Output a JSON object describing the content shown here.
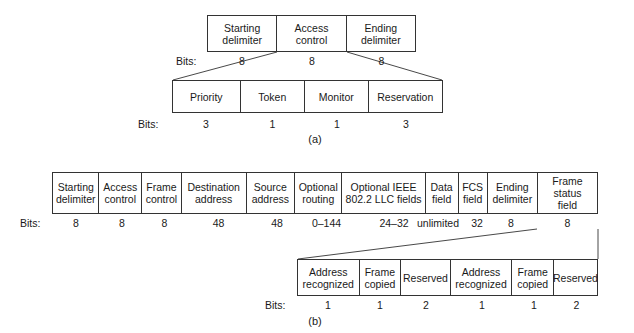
{
  "figure": {
    "section_a": {
      "caption": "(a)",
      "bits_label": "Bits:",
      "top_row": {
        "fields": [
          {
            "label": "Starting\ndelimiter",
            "bits": "8"
          },
          {
            "label": "Access\ncontrol",
            "bits": "8"
          },
          {
            "label": "Ending\ndelimiter",
            "bits": "8"
          }
        ]
      },
      "detail_row": {
        "fields": [
          {
            "label": "Priority",
            "bits": "3"
          },
          {
            "label": "Token",
            "bits": "1"
          },
          {
            "label": "Monitor",
            "bits": "1"
          },
          {
            "label": "Reservation",
            "bits": "3"
          }
        ]
      }
    },
    "section_b": {
      "caption": "(b)",
      "bits_label": "Bits:",
      "frame_row": {
        "fields": [
          {
            "label": "Starting\ndelimiter",
            "bits": "8"
          },
          {
            "label": "Access\ncontrol",
            "bits": "8"
          },
          {
            "label": "Frame\ncontrol",
            "bits": "8"
          },
          {
            "label": "Destination\naddress",
            "bits": "48"
          },
          {
            "label": "Source\naddress",
            "bits": "48"
          },
          {
            "label": "Optional\nrouting",
            "bits": "0–144"
          },
          {
            "label": "Optional IEEE\n802.2 LLC fields",
            "bits": "24–32"
          },
          {
            "label": "Data\nfield",
            "bits": "unlimited"
          },
          {
            "label": "FCS\nfield",
            "bits": "32"
          },
          {
            "label": "Ending\ndelimiter",
            "bits": "8"
          },
          {
            "label": "Frame status\nfield",
            "bits": "8"
          }
        ]
      },
      "status_detail_row": {
        "fields": [
          {
            "label": "Address\nrecognized",
            "bits": "1"
          },
          {
            "label": "Frame\ncopied",
            "bits": "1"
          },
          {
            "label": "Reserved",
            "bits": "2"
          },
          {
            "label": "Address\nrecognized",
            "bits": "1"
          },
          {
            "label": "Frame\ncopied",
            "bits": "1"
          },
          {
            "label": "Reserved",
            "bits": "2"
          }
        ]
      }
    }
  },
  "style": {
    "line_color": "#333333",
    "text_color": "#1a1a1a",
    "background": "#ffffff"
  }
}
